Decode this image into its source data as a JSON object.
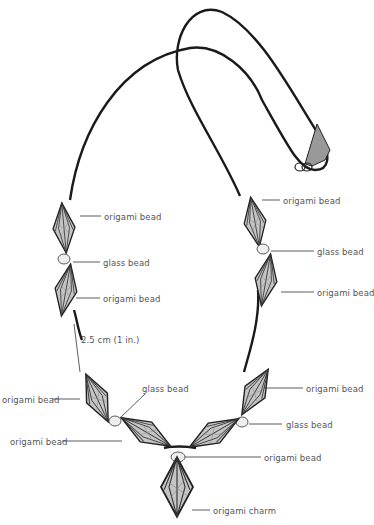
{
  "diagram": {
    "colors": {
      "cord": "#1a1a1a",
      "bead_fill": "#b8b8b8",
      "bead_stroke": "#2a2a2a",
      "label": "#555555",
      "leader": "#333333"
    },
    "labels": [
      {
        "id": "l1",
        "text": "origami bead",
        "x": 104,
        "y": 212
      },
      {
        "id": "l2",
        "text": "glass bead",
        "x": 103,
        "y": 258
      },
      {
        "id": "l3",
        "text": "origami bead",
        "x": 103,
        "y": 294
      },
      {
        "id": "l4",
        "text": "2.5 cm (1 in.)",
        "x": 81,
        "y": 335
      },
      {
        "id": "l5",
        "text": "origami bead",
        "x": 2,
        "y": 395
      },
      {
        "id": "l6",
        "text": "glass bead",
        "x": 142,
        "y": 384
      },
      {
        "id": "l7",
        "text": "origami bead",
        "x": 10,
        "y": 437
      },
      {
        "id": "l8",
        "text": "origami bead",
        "x": 306,
        "y": 384
      },
      {
        "id": "l9",
        "text": "glass bead",
        "x": 286,
        "y": 420
      },
      {
        "id": "l10",
        "text": "origami bead",
        "x": 264,
        "y": 453
      },
      {
        "id": "l11",
        "text": "origami charm",
        "x": 213,
        "y": 506
      },
      {
        "id": "r1",
        "text": "origami bead",
        "x": 283,
        "y": 196
      },
      {
        "id": "r2",
        "text": "glass bead",
        "x": 317,
        "y": 247
      },
      {
        "id": "r3",
        "text": "origami bead",
        "x": 317,
        "y": 288
      }
    ]
  }
}
